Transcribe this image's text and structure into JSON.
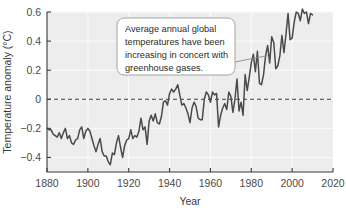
{
  "chart_data": {
    "type": "line",
    "title": "",
    "xlabel": "Year",
    "ylabel": "Temperature anomaly (°C)",
    "xlim": [
      1880,
      2020
    ],
    "ylim": [
      -0.5,
      0.6
    ],
    "xticks": [
      1880,
      1900,
      1920,
      1940,
      1960,
      1980,
      2000,
      2020
    ],
    "yticks": [
      -0.4,
      -0.2,
      0,
      0.2,
      0.4,
      0.6
    ],
    "xtick_labels": [
      "1880",
      "1900",
      "1920",
      "1940",
      "1960",
      "1980",
      "2000",
      "2020"
    ],
    "ytick_labels": [
      "−0.4",
      "−0.2",
      "0",
      "0.2",
      "0.4",
      "0.6"
    ],
    "grid": true,
    "legend": null,
    "reference_line": {
      "y": 0,
      "style": "dashed",
      "label": "0"
    },
    "series": [
      {
        "name": "Global annual temperature anomaly",
        "color": "#4a4a4a",
        "x": [
          1880,
          1881,
          1882,
          1883,
          1884,
          1885,
          1886,
          1887,
          1888,
          1889,
          1890,
          1891,
          1892,
          1893,
          1894,
          1895,
          1896,
          1897,
          1898,
          1899,
          1900,
          1901,
          1902,
          1903,
          1904,
          1905,
          1906,
          1907,
          1908,
          1909,
          1910,
          1911,
          1912,
          1913,
          1914,
          1915,
          1916,
          1917,
          1918,
          1919,
          1920,
          1921,
          1922,
          1923,
          1924,
          1925,
          1926,
          1927,
          1928,
          1929,
          1930,
          1931,
          1932,
          1933,
          1934,
          1935,
          1936,
          1937,
          1938,
          1939,
          1940,
          1941,
          1942,
          1943,
          1944,
          1945,
          1946,
          1947,
          1948,
          1949,
          1950,
          1951,
          1952,
          1953,
          1954,
          1955,
          1956,
          1957,
          1958,
          1959,
          1960,
          1961,
          1962,
          1963,
          1964,
          1965,
          1966,
          1967,
          1968,
          1969,
          1970,
          1971,
          1972,
          1973,
          1974,
          1975,
          1976,
          1977,
          1978,
          1979,
          1980,
          1981,
          1982,
          1983,
          1984,
          1985,
          1986,
          1987,
          1988,
          1989,
          1990,
          1991,
          1992,
          1993,
          1994,
          1995,
          1996,
          1997,
          1998,
          1999,
          2000,
          2001,
          2002,
          2003,
          2004,
          2005,
          2006,
          2007,
          2008,
          2009,
          2010
        ],
        "y": [
          -0.2,
          -0.21,
          -0.21,
          -0.24,
          -0.25,
          -0.26,
          -0.23,
          -0.27,
          -0.23,
          -0.2,
          -0.27,
          -0.25,
          -0.3,
          -0.31,
          -0.28,
          -0.27,
          -0.21,
          -0.19,
          -0.27,
          -0.22,
          -0.2,
          -0.22,
          -0.27,
          -0.32,
          -0.36,
          -0.31,
          -0.27,
          -0.36,
          -0.39,
          -0.39,
          -0.43,
          -0.45,
          -0.37,
          -0.38,
          -0.3,
          -0.25,
          -0.33,
          -0.4,
          -0.32,
          -0.28,
          -0.27,
          -0.21,
          -0.27,
          -0.25,
          -0.26,
          -0.22,
          -0.13,
          -0.21,
          -0.19,
          -0.31,
          -0.15,
          -0.11,
          -0.15,
          -0.1,
          -0.16,
          -0.17,
          -0.12,
          -0.02,
          -0.01,
          -0.04,
          0.04,
          0.07,
          0.05,
          0.07,
          0.1,
          0.03,
          -0.04,
          -0.03,
          -0.06,
          -0.1,
          -0.16,
          -0.06,
          -0.02,
          -0.05,
          -0.13,
          -0.14,
          -0.14,
          0.0,
          0.05,
          0.03,
          -0.02,
          0.05,
          0.03,
          0.04,
          -0.19,
          -0.11,
          -0.06,
          -0.03,
          -0.07,
          0.05,
          0.02,
          -0.09,
          0.0,
          0.14,
          -0.08,
          -0.02,
          -0.11,
          0.17,
          0.06,
          0.15,
          0.25,
          0.31,
          0.19,
          0.33,
          0.11,
          0.1,
          0.17,
          0.3,
          0.37,
          0.25,
          0.43,
          0.39,
          0.21,
          0.23,
          0.3,
          0.44,
          0.32,
          0.45,
          0.59,
          0.41,
          0.42,
          0.53,
          0.6,
          0.59,
          0.54,
          0.62,
          0.59,
          0.6,
          0.52,
          0.59,
          0.58
        ]
      }
    ],
    "annotations": [
      {
        "name": "warming-callout",
        "text": "Average annual global temperatures have been increasing in concert with greenhouse gases.",
        "lines": [
          "Average annual global",
          "temperatures have been",
          "increasing in concert with",
          "greenhouse gases."
        ],
        "points_to": {
          "x": 1988,
          "y": 0.3
        }
      }
    ],
    "colors": {
      "plot_background": "#ededed",
      "gridline": "#fbfbfb",
      "line": "#4a4a4a",
      "axis": "#3a3a3a",
      "zero_line": "#3a3a3a",
      "callout_fill": "#ffffff",
      "callout_border": "#9a9a9a",
      "page_background": "#ffffff"
    }
  }
}
